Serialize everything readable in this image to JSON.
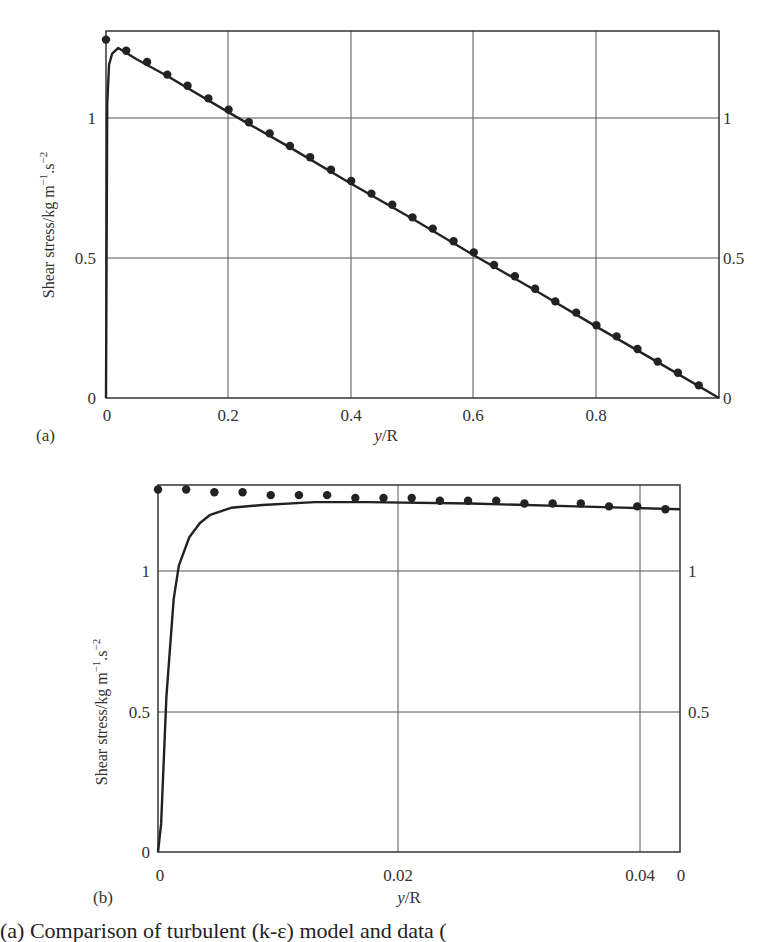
{
  "chart_data": [
    {
      "panel": "(a)",
      "type": "line",
      "title": "",
      "xlabel": "y/R",
      "ylabel": "Shear stress/kg m⁻¹.s⁻²",
      "xlim": [
        0,
        1.0
      ],
      "ylim": [
        0,
        1.3
      ],
      "x_ticks": [
        "0",
        "0.2",
        "0.4",
        "0.6",
        "0.8"
      ],
      "y_ticks_left": [
        "0",
        "0.5",
        "1"
      ],
      "y_ticks_right": [
        "0",
        "0.5",
        "1"
      ],
      "grid": true,
      "series": [
        {
          "name": "model (line)",
          "style": "line",
          "x": [
            0,
            0.002,
            0.005,
            0.01,
            0.02,
            0.05,
            0.1,
            0.2,
            0.3,
            0.4,
            0.5,
            0.6,
            0.7,
            0.8,
            0.9,
            1.0
          ],
          "values": [
            0,
            1.05,
            1.19,
            1.23,
            1.25,
            1.21,
            1.15,
            1.02,
            0.895,
            0.765,
            0.64,
            0.51,
            0.385,
            0.255,
            0.128,
            0
          ]
        },
        {
          "name": "data (markers)",
          "style": "markers",
          "x": [
            0,
            0.033,
            0.067,
            0.1,
            0.133,
            0.167,
            0.2,
            0.233,
            0.267,
            0.3,
            0.333,
            0.367,
            0.4,
            0.433,
            0.467,
            0.5,
            0.533,
            0.567,
            0.6,
            0.633,
            0.667,
            0.7,
            0.733,
            0.767,
            0.8,
            0.833,
            0.867,
            0.9,
            0.933,
            0.967
          ],
          "values": [
            1.28,
            1.24,
            1.2,
            1.155,
            1.115,
            1.07,
            1.03,
            0.985,
            0.945,
            0.9,
            0.86,
            0.815,
            0.775,
            0.73,
            0.69,
            0.645,
            0.605,
            0.56,
            0.52,
            0.475,
            0.435,
            0.39,
            0.345,
            0.305,
            0.26,
            0.22,
            0.175,
            0.13,
            0.09,
            0.045
          ]
        }
      ]
    },
    {
      "panel": "(b)",
      "type": "line",
      "title": "",
      "xlabel": "y/R",
      "ylabel": "Shear stress/kg m⁻¹.s⁻²",
      "xlim": [
        0,
        0.05
      ],
      "ylim": [
        0,
        1.3
      ],
      "x_ticks": [
        "0",
        "0.02",
        "0.04",
        "0"
      ],
      "y_ticks_left": [
        "0",
        "0.5",
        "1"
      ],
      "y_ticks_right": [
        "0.5",
        "1"
      ],
      "grid": true,
      "series": [
        {
          "name": "model (line)",
          "style": "line",
          "x": [
            0,
            0.0003,
            0.0008,
            0.0015,
            0.002,
            0.003,
            0.004,
            0.005,
            0.007,
            0.01,
            0.015,
            0.02,
            0.03,
            0.04,
            0.05
          ],
          "values": [
            0,
            0.1,
            0.55,
            0.9,
            1.02,
            1.12,
            1.17,
            1.2,
            1.225,
            1.235,
            1.245,
            1.245,
            1.24,
            1.23,
            1.22
          ]
        },
        {
          "name": "data (markers)",
          "style": "markers",
          "x": [
            0,
            0.0027,
            0.0054,
            0.0081,
            0.0108,
            0.0135,
            0.0162,
            0.0189,
            0.0216,
            0.0243,
            0.027,
            0.0297,
            0.0324,
            0.0351,
            0.0378,
            0.0405,
            0.0432,
            0.0459,
            0.0486
          ],
          "values": [
            1.29,
            1.29,
            1.28,
            1.28,
            1.27,
            1.27,
            1.27,
            1.26,
            1.26,
            1.26,
            1.25,
            1.25,
            1.25,
            1.24,
            1.24,
            1.24,
            1.23,
            1.23,
            1.22
          ]
        }
      ]
    }
  ],
  "panels": {
    "a": {
      "label": "(a)",
      "xlabel_italic": "y",
      "xlabel_rest": "/R",
      "ylabel": "Shear stress/kg m",
      "ylabel_sup1": "−1",
      "ylabel_mid": ".s",
      "ylabel_sup2": "−2",
      "x_ticks": [
        "0",
        "0.2",
        "0.4",
        "0.6",
        "0.8"
      ],
      "y_left": [
        "0",
        "0.5",
        "1"
      ],
      "y_right": [
        "0",
        "0.5",
        "1"
      ]
    },
    "b": {
      "label": "(b)",
      "xlabel_italic": "y",
      "xlabel_rest": "/R",
      "ylabel": "Shear stress/kg m",
      "ylabel_sup1": "−1",
      "ylabel_mid": ".s",
      "ylabel_sup2": "−2",
      "x_ticks": [
        "0",
        "0.02",
        "0.04",
        "0"
      ],
      "y_left": [
        "0",
        "0.5",
        "1"
      ],
      "y_right": [
        "0.5",
        "1"
      ]
    }
  },
  "caption": "(a) Comparison of turbulent (k-ε) model and data (",
  "colors": {
    "ink": "#222222",
    "grid": "#444444",
    "bg": "#ffffff"
  }
}
